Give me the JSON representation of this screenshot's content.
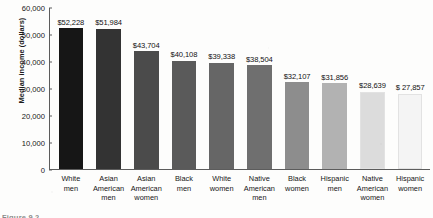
{
  "chart_data": {
    "type": "bar",
    "title": "",
    "xlabel": "",
    "ylabel": "Median income (dollars)",
    "ylim": [
      0,
      60000
    ],
    "grid": false,
    "legend": "none",
    "ytick_labels": [
      "60,000",
      "50,000",
      "40,000",
      "30,000",
      "20,000",
      "10,000",
      "0"
    ],
    "ytick_values": [
      60000,
      50000,
      40000,
      30000,
      20000,
      10000,
      0
    ],
    "categories": [
      "White\nmen",
      "Asian\nAmerican\nmen",
      "Asian\nAmerican\nwomen",
      "Black\nmen",
      "White\nwomen",
      "Native\nAmerican\nmen",
      "Black\nwomen",
      "Hispanic\nmen",
      "Native\nAmerican\nwomen",
      "Hispanic\nwomen"
    ],
    "values": [
      52228,
      51984,
      43704,
      40108,
      39338,
      38504,
      32107,
      31856,
      28639,
      27857
    ],
    "data_labels": [
      "$52,228",
      "$51,984",
      "$43,704",
      "$40,108",
      "$39,338",
      "$38,504",
      "$32,107",
      "$31,856",
      "$28,639",
      "$ 27,857"
    ],
    "bar_colors": [
      "#161616",
      "#333333",
      "#4b4b4b",
      "#5a5a5a",
      "#666666",
      "#6f6f6f",
      "#8d8d8d",
      "#b2b2b2",
      "#dcdcdc",
      "#f4f4f4"
    ]
  },
  "caption": {
    "text": "Figure 9.2"
  }
}
